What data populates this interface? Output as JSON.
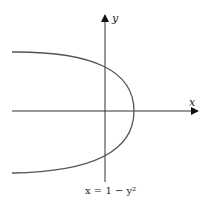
{
  "diagram": {
    "x_axis_label": "x",
    "y_axis_label": "y",
    "equation_caption": "x = 1 − y²",
    "curve": {
      "type": "parabola",
      "equation": "x = 1 - y^2",
      "vertex": [
        1,
        0
      ],
      "y_intercepts": [
        1,
        -1
      ],
      "opens": "left"
    },
    "colors": {
      "axis": "#222222",
      "curve": "#555555"
    }
  }
}
